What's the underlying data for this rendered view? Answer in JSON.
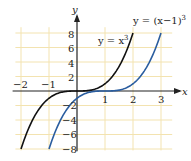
{
  "chart_data": {
    "type": "line",
    "title": "",
    "xlabel": "x",
    "ylabel": "y",
    "xlim": [
      -2.2,
      3.3
    ],
    "ylim": [
      -8.2,
      9
    ],
    "grid": true,
    "x_ticks": [
      "-2",
      "-1",
      "1",
      "2",
      "3"
    ],
    "y_ticks": [
      "8",
      "6",
      "4",
      "2",
      "-2",
      "-4",
      "-6",
      "-8"
    ],
    "series": [
      {
        "name": "y = x^3",
        "color": "#111111",
        "x_range": [
          -2,
          2
        ],
        "function": "x^3"
      },
      {
        "name": "y = (x-1)^3",
        "color": "#2a5d9f",
        "x_range": [
          -1,
          3
        ],
        "function": "(x-1)^3"
      }
    ],
    "annotations": [
      {
        "text": "y = x",
        "sup": "3",
        "near": "black curve"
      },
      {
        "text": "y = (x−1)",
        "sup": "3",
        "near": "blue curve"
      }
    ]
  },
  "labels": {
    "x_axis": "x",
    "y_axis": "y",
    "curve1_main": "y = x",
    "curve1_sup": "3",
    "curve2_main": "y = (x−1)",
    "curve2_sup": "3",
    "xt": [
      "−2",
      "−1",
      "1",
      "2",
      "3"
    ],
    "yt": [
      "8",
      "6",
      "4",
      "2",
      "−2",
      "−4",
      "−6",
      "−8"
    ]
  }
}
